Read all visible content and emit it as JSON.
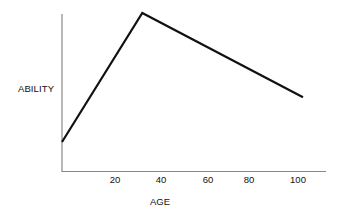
{
  "chart_data": {
    "type": "line",
    "title": "",
    "xlabel": "AGE",
    "ylabel": "ABILITY",
    "x_ticks": [
      "20",
      "40",
      "60",
      "80",
      "100"
    ],
    "x": [
      0,
      34,
      102
    ],
    "series": [
      {
        "name": "Ability",
        "values": [
          0.22,
          1.0,
          0.49
        ],
        "color": "#111111"
      }
    ],
    "xlim": [
      0,
      112
    ],
    "ylim": [
      0,
      1
    ],
    "y_ticks": [],
    "grid": false,
    "legend": "none"
  },
  "labels": {
    "ylabel": "ABILITY",
    "xlabel": "AGE",
    "ticks": [
      "20",
      "40",
      "60",
      "80",
      "100"
    ]
  }
}
